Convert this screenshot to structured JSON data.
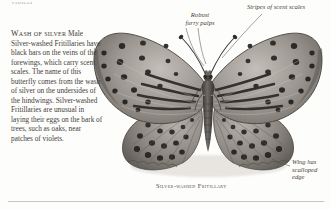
{
  "page": {
    "background_color": "#fdfdfc",
    "rule_color": "#c9c4bd",
    "cutoff_top_text": "violets"
  },
  "body_text": {
    "heading": "Wash of silver",
    "paragraph": "Male Silver-washed Fritillaries have black bars on the veins of the forewings, which carry scent scales. The name of this butterfly comes from the wash of silver on the undersides of the hindwings. Silver-washed Fritillaries are unusual in laying their eggs on the bark of trees, such as oaks, near patches of violets."
  },
  "annotations": [
    {
      "id": "palps",
      "text": "Robust\nfurry palps"
    },
    {
      "id": "stripes",
      "text": "Stripes of scent scales"
    },
    {
      "id": "scalloped",
      "text": "Wing has\nscalloped\nedge"
    }
  ],
  "caption": {
    "label": "Silver-washed Fritillary"
  },
  "specimen": {
    "name": "silver-washed-fritillary-specimen",
    "alt": "Mounted butterfly specimen, wings spread, greyscale photograph",
    "wing_color": "#8e8a84",
    "wing_light": "#b4b0a9",
    "spot_color": "#2c2a27",
    "body_color": "#55514c"
  }
}
